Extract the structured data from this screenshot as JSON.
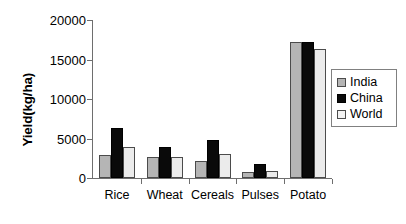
{
  "chart_data": {
    "type": "bar",
    "title": "",
    "xlabel": "",
    "ylabel": "Yield(kg/ha)",
    "categories": [
      "Rice",
      "Wheat",
      "Cereals",
      "Pulses",
      "Potato"
    ],
    "series": [
      {
        "name": "India",
        "color": "#b5b5b5",
        "values": [
          2900,
          2600,
          2200,
          700,
          17200
        ]
      },
      {
        "name": "China",
        "color": "#0a0a0a",
        "values": [
          6300,
          3900,
          4800,
          1800,
          17200
        ]
      },
      {
        "name": "World",
        "color": "#ebebeb",
        "values": [
          3900,
          2700,
          3000,
          900,
          16300
        ]
      }
    ],
    "ylim": [
      0,
      20000
    ],
    "ytick_labels": [
      "20000",
      "15000",
      "10000",
      "5000",
      "0"
    ],
    "ytick_values": [
      20000,
      15000,
      10000,
      5000,
      0
    ],
    "grid": false,
    "legend_position": "right",
    "legend_entries": [
      "India",
      "China",
      "World"
    ]
  }
}
